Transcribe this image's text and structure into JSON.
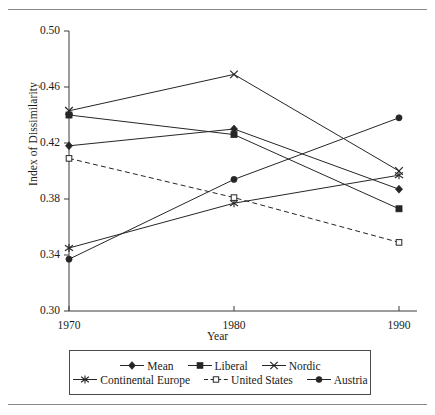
{
  "figure": {
    "background": "#ffffff",
    "line_color": "#262626",
    "rule_color": "#8a8a8a"
  },
  "axis": {
    "ylabel": "Index of Dissimilarity",
    "xlabel": "Year",
    "yticks": [
      "0.50",
      "0.46",
      "0.42",
      "0.38",
      "0.34",
      "0.30"
    ],
    "xticks": [
      "1970",
      "1980",
      "1990"
    ]
  },
  "legend": {
    "rows": [
      [
        {
          "label": "Mean",
          "marker": "diamond-filled-marker",
          "dash": false
        },
        {
          "label": "Liberal",
          "marker": "square-filled-marker",
          "dash": false
        },
        {
          "label": "Nordic",
          "marker": "x-cross-marker",
          "dash": false
        }
      ],
      [
        {
          "label": "Continental Europe",
          "marker": "asterisk-marker",
          "dash": false
        },
        {
          "label": "United States",
          "marker": "square-open-marker",
          "dash": true
        },
        {
          "label": "Austria",
          "marker": "circle-filled-marker",
          "dash": false
        }
      ]
    ]
  },
  "chart_data": {
    "type": "line",
    "title": "",
    "xlabel": "Year",
    "ylabel": "Index of Dissimilarity",
    "x": [
      1970,
      1980,
      1990
    ],
    "xlim": [
      1965,
      1995
    ],
    "ylim": [
      0.3,
      0.5
    ],
    "ytick_values": [
      0.5,
      0.46,
      0.42,
      0.38,
      0.34,
      0.3
    ],
    "grid": false,
    "legend_position": "bottom",
    "series": [
      {
        "name": "Mean",
        "marker": "diamond-filled",
        "dash": false,
        "values": [
          0.418,
          0.43,
          0.387
        ]
      },
      {
        "name": "Liberal",
        "marker": "square-filled",
        "dash": false,
        "values": [
          0.44,
          0.426,
          0.373
        ]
      },
      {
        "name": "Nordic",
        "marker": "x-cross",
        "dash": false,
        "values": [
          0.443,
          0.469,
          0.4
        ]
      },
      {
        "name": "Continental Europe",
        "marker": "asterisk",
        "dash": false,
        "values": [
          0.345,
          0.377,
          0.397
        ]
      },
      {
        "name": "United States",
        "marker": "square-open",
        "dash": true,
        "values": [
          0.409,
          0.381,
          0.349
        ]
      },
      {
        "name": "Austria",
        "marker": "circle-filled",
        "dash": false,
        "values": [
          0.337,
          0.394,
          0.438
        ]
      }
    ]
  }
}
